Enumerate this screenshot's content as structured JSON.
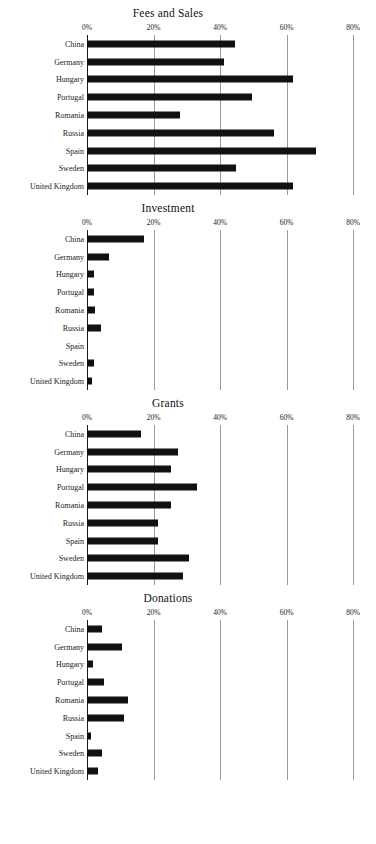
{
  "figure": {
    "countries": [
      "China",
      "Germany",
      "Hungary",
      "Portugal",
      "Romania",
      "Russia",
      "Spain",
      "Sweden",
      "United Kingdom"
    ],
    "tick_labels": [
      "0%",
      "20%",
      "40%",
      "60%",
      "80%"
    ],
    "tick_values": [
      0,
      20,
      40,
      60,
      80
    ],
    "bar_color": "#111111",
    "grid_color": "#9a9a9a",
    "axis_color": "#1a1a1a"
  },
  "panels": [
    {
      "title": "Fees and Sales"
    },
    {
      "title": "Investment"
    },
    {
      "title": "Grants"
    },
    {
      "title": "Donations"
    }
  ],
  "chart_data": [
    {
      "type": "bar",
      "orientation": "horizontal",
      "title": "Fees and Sales",
      "xlabel": "",
      "ylabel": "",
      "xlim": [
        0,
        80
      ],
      "xticks": [
        0,
        20,
        40,
        60,
        80
      ],
      "xticklabels": [
        "0%",
        "20%",
        "40%",
        "60%",
        "80%"
      ],
      "grid": true,
      "legend": false,
      "categories": [
        "China",
        "Germany",
        "Hungary",
        "Portugal",
        "Romania",
        "Russia",
        "Spain",
        "Sweden",
        "United Kingdom"
      ],
      "values": [
        44.5,
        41.2,
        62.0,
        49.6,
        28.0,
        56.2,
        69.0,
        44.8,
        62.0
      ]
    },
    {
      "type": "bar",
      "orientation": "horizontal",
      "title": "Investment",
      "xlabel": "",
      "ylabel": "",
      "xlim": [
        0,
        80
      ],
      "xticks": [
        0,
        20,
        40,
        60,
        80
      ],
      "xticklabels": [
        "0%",
        "20%",
        "40%",
        "60%",
        "80%"
      ],
      "grid": true,
      "legend": false,
      "categories": [
        "China",
        "Germany",
        "Hungary",
        "Portugal",
        "Romania",
        "Russia",
        "Spain",
        "Sweden",
        "United Kingdom"
      ],
      "values": [
        17.1,
        6.6,
        2.1,
        2.1,
        2.4,
        4.1,
        0.0,
        2.2,
        1.6
      ]
    },
    {
      "type": "bar",
      "orientation": "horizontal",
      "title": "Grants",
      "xlabel": "",
      "ylabel": "",
      "xlim": [
        0,
        80
      ],
      "xticks": [
        0,
        20,
        40,
        60,
        80
      ],
      "xticklabels": [
        "0%",
        "20%",
        "40%",
        "60%",
        "80%"
      ],
      "grid": true,
      "legend": false,
      "categories": [
        "China",
        "Germany",
        "Hungary",
        "Portugal",
        "Romania",
        "Russia",
        "Spain",
        "Sweden",
        "United Kingdom"
      ],
      "values": [
        16.2,
        27.3,
        25.3,
        33.2,
        25.3,
        21.3,
        21.3,
        30.8,
        29.0
      ]
    },
    {
      "type": "bar",
      "orientation": "horizontal",
      "title": "Donations",
      "xlabel": "",
      "ylabel": "",
      "xlim": [
        0,
        80
      ],
      "xticks": [
        0,
        20,
        40,
        60,
        80
      ],
      "xticklabels": [
        "0%",
        "20%",
        "40%",
        "60%",
        "80%"
      ],
      "grid": true,
      "legend": false,
      "categories": [
        "China",
        "Germany",
        "Hungary",
        "Portugal",
        "Romania",
        "Russia",
        "Spain",
        "Sweden",
        "United Kingdom"
      ],
      "values": [
        4.6,
        10.4,
        1.9,
        5.2,
        12.2,
        11.2,
        1.1,
        4.4,
        3.2
      ]
    }
  ]
}
